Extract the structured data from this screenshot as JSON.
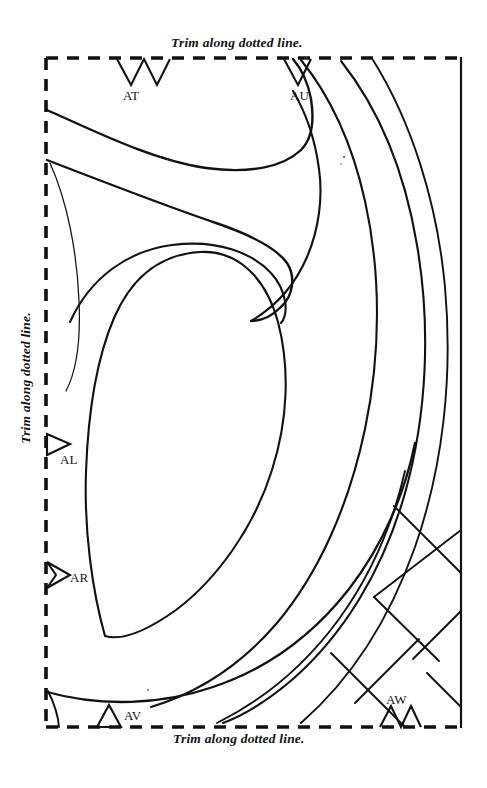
{
  "page": {
    "kind": "pattern-template-sheet",
    "background_color": "#ffffff",
    "ink_color": "#111111",
    "width": 487,
    "height": 788
  },
  "trim_instructions": {
    "top": "Trim along dotted line.",
    "bottom": "Trim along dotted line.",
    "left": "Trim along dotted line."
  },
  "notches": [
    {
      "id": "AT",
      "label": "AT",
      "edge": "top",
      "shape": "double-v",
      "x": 140,
      "y": 62
    },
    {
      "id": "AU",
      "label": "AU",
      "edge": "top",
      "shape": "single-v",
      "x": 298,
      "y": 62
    },
    {
      "id": "AL",
      "label": "AL",
      "edge": "left",
      "shape": "single-triangle-right",
      "x": 47,
      "y": 443
    },
    {
      "id": "AR",
      "label": "AR",
      "edge": "left",
      "shape": "double-triangle-right",
      "x": 47,
      "y": 575
    },
    {
      "id": "AV",
      "label": "AV",
      "edge": "bottom",
      "shape": "single-triangle-up",
      "x": 108,
      "y": 727
    },
    {
      "id": "AW",
      "label": "AW",
      "edge": "bottom",
      "shape": "double-triangle-up",
      "x": 400,
      "y": 727
    }
  ],
  "border": {
    "dashed_color": "#111111",
    "dash_pattern": "12 9",
    "dash_width": 3.6,
    "left_x": 46,
    "top_y": 58,
    "bottom_y": 727,
    "right_solid_x": 461,
    "right_solid_top": 58,
    "right_solid_bottom": 727,
    "solid_width": 2.2
  },
  "paths": {
    "stroke_color": "#111111",
    "thick_width": 2.3,
    "thin_width": 1.3,
    "shapes": [
      {
        "name": "upper-left-scroll-outer",
        "d": "M47,110 C90,128 150,158 205,166 C250,173 282,166 300,150 C312,139 313,120 310,100 C306,78 298,66 292,59"
      },
      {
        "name": "upper-left-scroll-inner",
        "d": "M47,160 C95,178 165,205 215,222 C253,235 276,248 286,262 C295,276 292,294 280,306 C270,316 258,320 250,320"
      },
      {
        "name": "left-thin-arc",
        "d": "M50,162 C66,200 76,250 78,300 C80,344 76,370 66,390"
      },
      {
        "name": "inner-petal",
        "d": "M72,320 C92,276 128,250 172,244 C218,238 252,252 270,272 C286,290 288,312 280,322"
      },
      {
        "name": "teardrop-leaf",
        "d": "M105,636 C92,590 84,530 86,472 C88,414 96,360 114,318 C134,272 164,254 200,252 C238,250 266,278 278,322 C290,368 288,420 272,470 C254,528 216,580 176,610 C148,630 122,640 105,636 Z"
      },
      {
        "name": "outer-sweep-1",
        "d": "M300,59 C330,96 352,146 364,200 C380,272 380,352 364,428 C348,504 318,572 276,622 C240,664 196,692 150,706"
      },
      {
        "name": "outer-sweep-2",
        "d": "M340,60 C378,108 404,172 416,244 C430,326 426,414 404,492 C382,570 342,634 292,678 C264,702 238,716 222,722"
      },
      {
        "name": "right-rim",
        "d": "M372,59 C410,120 436,200 444,286 C452,376 442,466 414,546 C388,620 348,680 300,722"
      },
      {
        "name": "throat-curve",
        "d": "M250,322 C274,308 294,286 306,258 C318,230 322,198 318,170 C314,140 304,112 292,92"
      },
      {
        "name": "bottom-sweep",
        "d": "M47,692 C100,706 160,704 212,686 C266,668 312,634 348,588 C382,544 404,492 414,442"
      },
      {
        "name": "bottom-inner-sweep",
        "d": "M216,722 C264,698 306,662 338,618 C370,574 392,522 404,470"
      },
      {
        "name": "left-foot-hook",
        "d": "M47,690 C52,700 57,712 58,726"
      },
      {
        "name": "lattice-a",
        "d": "M394,506 L460,572"
      },
      {
        "name": "lattice-b",
        "d": "M438,530 L374,596"
      },
      {
        "name": "lattice-c",
        "d": "M374,596 L438,660"
      },
      {
        "name": "lattice-d",
        "d": "M418,638 L354,702"
      },
      {
        "name": "lattice-e",
        "d": "M330,652 L404,726"
      },
      {
        "name": "lattice-f",
        "d": "M460,610 L412,658"
      },
      {
        "name": "lattice-g",
        "d": "M426,672 L461,706"
      }
    ]
  }
}
